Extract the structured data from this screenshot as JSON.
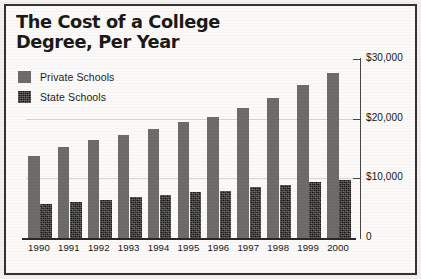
{
  "title": "The Cost of a College\nDegree, Per Year",
  "legend": {
    "items": [
      {
        "label": "Private Schools",
        "swatch": "gray-solid-swatch",
        "color": "#6e6c68"
      },
      {
        "label": "State Schools",
        "swatch": "black-textured-swatch",
        "color": "#181715"
      }
    ]
  },
  "axes": {
    "y_ticks": [
      "$30,000",
      "$20,000",
      "$10,000",
      "0"
    ],
    "y_tick_values": [
      30000,
      20000,
      10000,
      0
    ],
    "y_axis_position": "right",
    "x_ticks": [
      "1990",
      "1991",
      "1992",
      "1993",
      "1994",
      "1995",
      "1996",
      "1997",
      "1998",
      "1999",
      "2000"
    ]
  },
  "colors": {
    "private": "#6e6c68",
    "state": "#181715",
    "frame": "#35332f",
    "background": "#fbfaf8",
    "gridline": "#d9d7d2",
    "axis": "#4a4845",
    "text": "#1a1816"
  },
  "chart_data": {
    "type": "bar",
    "title": "The Cost of a College Degree, Per Year",
    "xlabel": "",
    "ylabel": "",
    "ylim": [
      0,
      30000
    ],
    "yticks": [
      0,
      10000,
      20000,
      30000
    ],
    "grid": true,
    "legend_position": "top-left",
    "categories": [
      "1990",
      "1991",
      "1992",
      "1993",
      "1994",
      "1995",
      "1996",
      "1997",
      "1998",
      "1999",
      "2000"
    ],
    "series": [
      {
        "name": "Private Schools",
        "color": "#6e6c68",
        "values": [
          13800,
          15300,
          16400,
          17200,
          18300,
          19500,
          20300,
          21800,
          23500,
          25700,
          27600
        ]
      },
      {
        "name": "State Schools",
        "color": "#181715",
        "values": [
          5700,
          6100,
          6300,
          6800,
          7200,
          7700,
          7900,
          8600,
          8900,
          9400,
          9800
        ]
      }
    ]
  }
}
